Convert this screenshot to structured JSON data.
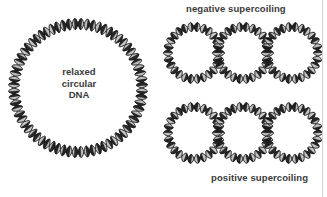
{
  "figure": {
    "background_color": "#ffffff",
    "border_color": "#d2d2d2",
    "width": 327,
    "height": 197
  },
  "labels": {
    "negative_supercoiling": "negative supercoiling",
    "positive_supercoiling": "positive supercoiling"
  },
  "center_caption": {
    "line1": "relaxed",
    "line2": "circular",
    "line3": "DNA",
    "color": "#3a3a3a"
  },
  "diagram": {
    "style": {
      "strand_dark_color": "#1a1a1a",
      "strand_light_color": "#f2f2f2",
      "outline_color": "#333333",
      "shadow_color": "#9a9a9a"
    },
    "relaxed_circle": {
      "center_x": 78,
      "center_y": 88,
      "radius": 64,
      "helix_turns": 34,
      "ribbon_width": 11
    },
    "negative_supercoil_rings": [
      {
        "center_x": 194,
        "center_y": 53,
        "radius": 26,
        "helix_turns": 13,
        "ribbon_width": 9
      },
      {
        "center_x": 243,
        "center_y": 53,
        "radius": 26,
        "helix_turns": 13,
        "ribbon_width": 9
      },
      {
        "center_x": 292,
        "center_y": 53,
        "radius": 26,
        "helix_turns": 13,
        "ribbon_width": 9
      }
    ],
    "positive_supercoil_rings": [
      {
        "center_x": 194,
        "center_y": 133,
        "radius": 26,
        "helix_turns": 13,
        "ribbon_width": 9
      },
      {
        "center_x": 243,
        "center_y": 133,
        "radius": 26,
        "helix_turns": 13,
        "ribbon_width": 9
      },
      {
        "center_x": 292,
        "center_y": 133,
        "radius": 26,
        "helix_turns": 13,
        "ribbon_width": 9
      }
    ]
  }
}
